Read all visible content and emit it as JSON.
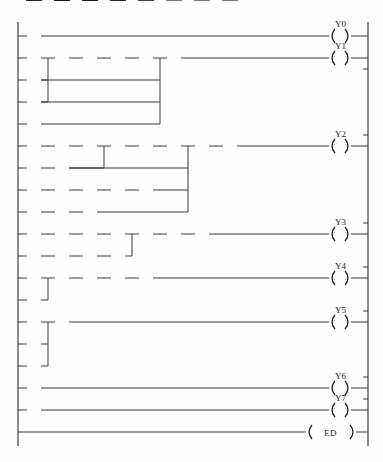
{
  "diagram": {
    "type": "ladder-logic",
    "end_instruction": "ED",
    "geometry": {
      "width": 383,
      "height": 462,
      "left_rail_x": 18,
      "right_rail_x": 368,
      "col_step": 28,
      "col0_x": 27,
      "row_step": 22,
      "row0_y": 36,
      "contact_w": 14,
      "coil_x": 340
    },
    "rungs": [
      {
        "id": "rung-1",
        "output": {
          "name": "Y0",
          "type": "coil"
        },
        "rows": [
          {
            "row": 0,
            "start_col": 0,
            "contacts": [
              {
                "name": "X0",
                "type": "NO",
                "col": 0
              }
            ]
          }
        ],
        "links": []
      },
      {
        "id": "rung-2",
        "output": {
          "name": "Y1",
          "type": "coil"
        },
        "rows": [
          {
            "row": 1,
            "start_col": 0,
            "contacts": [
              {
                "name": "X3",
                "type": "NO",
                "col": 0
              },
              {
                "name": "X1",
                "type": "NC",
                "col": 1
              },
              {
                "name": "X2",
                "type": "NC",
                "col": 2
              },
              {
                "name": "X7",
                "type": "NC",
                "col": 3
              },
              {
                "name": "XE",
                "type": "NC",
                "col": 4
              },
              {
                "name": "XD",
                "type": "NO",
                "col": 5
              }
            ]
          },
          {
            "row": 2,
            "start_col": 0,
            "contacts": [
              {
                "name": "X4",
                "type": "NO",
                "col": 0
              }
            ]
          },
          {
            "row": 3,
            "start_col": 0,
            "contacts": [
              {
                "name": "Y1",
                "type": "NO",
                "col": 0
              }
            ]
          },
          {
            "row": 4,
            "start_col": 0,
            "contacts": [
              {
                "name": "Y7",
                "type": "NO",
                "col": 0
              }
            ]
          }
        ],
        "links": [
          {
            "kind": "vertical",
            "at_col": 1,
            "from_row": 1,
            "to_row": 3
          },
          {
            "kind": "vertical",
            "at_col": 5,
            "from_row": 1,
            "to_row": 4
          }
        ]
      },
      {
        "id": "rung-3",
        "output": {
          "name": "Y2",
          "type": "coil"
        },
        "rows": [
          {
            "row": 5,
            "start_col": 0,
            "contacts": [
              {
                "name": "XB",
                "type": "NC",
                "col": 0
              },
              {
                "name": "XC",
                "type": "NC",
                "col": 1
              },
              {
                "name": "X10",
                "type": "NO",
                "col": 2
              },
              {
                "name": "X8",
                "type": "NC",
                "col": 3
              },
              {
                "name": "X9",
                "type": "NC",
                "col": 4
              },
              {
                "name": "XA",
                "type": "NC",
                "col": 5
              },
              {
                "name": "Y1",
                "type": "NO",
                "col": 6
              },
              {
                "name": "Y3",
                "type": "NC",
                "col": 7
              }
            ]
          },
          {
            "row": 6,
            "start_col": 0,
            "contacts": [
              {
                "name": "XF",
                "type": "NO",
                "col": 0
              },
              {
                "name": "XC",
                "type": "NO",
                "col": 1
              }
            ]
          },
          {
            "row": 7,
            "start_col": 0,
            "contacts": [
              {
                "name": "XA",
                "type": "NO",
                "col": 0
              },
              {
                "name": "XB",
                "type": "NC",
                "col": 1
              },
              {
                "name": "XC",
                "type": "NC",
                "col": 2
              },
              {
                "name": "XF",
                "type": "NO",
                "col": 3
              },
              {
                "name": "X11",
                "type": "NO",
                "col": 4
              }
            ]
          },
          {
            "row": 8,
            "start_col": 0,
            "contacts": [
              {
                "name": "X8",
                "type": "NO",
                "col": 0
              },
              {
                "name": "XF",
                "type": "NO",
                "col": 1
              },
              {
                "name": "X11",
                "type": "NO",
                "col": 2
              }
            ]
          }
        ],
        "links": [
          {
            "kind": "vertical",
            "at_col": 3,
            "from_row": 5,
            "to_row": 6
          },
          {
            "kind": "vertical",
            "at_col": 6,
            "from_row": 5,
            "to_row": 8
          }
        ]
      },
      {
        "id": "rung-4",
        "output": {
          "name": "Y3",
          "type": "coil"
        },
        "rows": [
          {
            "row": 9,
            "start_col": 0,
            "contacts": [
              {
                "name": "X8",
                "type": "NC",
                "col": 0
              },
              {
                "name": "X9",
                "type": "NC",
                "col": 1
              },
              {
                "name": "XA",
                "type": "NC",
                "col": 2
              },
              {
                "name": "XB",
                "type": "NO",
                "col": 3
              },
              {
                "name": "XF",
                "type": "NO",
                "col": 4
              },
              {
                "name": "Y1",
                "type": "NO",
                "col": 5
              },
              {
                "name": "Y2",
                "type": "NC",
                "col": 6
              }
            ]
          },
          {
            "row": 10,
            "start_col": 0,
            "contacts": [
              {
                "name": "X9",
                "type": "NO",
                "col": 0
              },
              {
                "name": "XB",
                "type": "NC",
                "col": 1
              },
              {
                "name": "XC",
                "type": "NC",
                "col": 2
              },
              {
                "name": "X11",
                "type": "NO",
                "col": 3
              }
            ]
          }
        ],
        "links": [
          {
            "kind": "vertical",
            "at_col": 4,
            "from_row": 9,
            "to_row": 10
          }
        ]
      },
      {
        "id": "rung-5",
        "output": {
          "name": "Y4",
          "type": "coil"
        },
        "rows": [
          {
            "row": 11,
            "start_col": 0,
            "contacts": [
              {
                "name": "X5",
                "type": "NO",
                "col": 0
              },
              {
                "name": "X1",
                "type": "NC",
                "col": 1
              },
              {
                "name": "X2",
                "type": "NC",
                "col": 2
              },
              {
                "name": "X7",
                "type": "NC",
                "col": 3
              },
              {
                "name": "XD",
                "type": "NO",
                "col": 4
              }
            ]
          },
          {
            "row": 12,
            "start_col": 0,
            "contacts": [
              {
                "name": "X6",
                "type": "NO",
                "col": 0
              }
            ]
          }
        ],
        "links": [
          {
            "kind": "vertical",
            "at_col": 1,
            "from_row": 11,
            "to_row": 12
          }
        ]
      },
      {
        "id": "rung-6",
        "output": {
          "name": "Y5",
          "type": "coil"
        },
        "rows": [
          {
            "row": 13,
            "start_col": 0,
            "contacts": [
              {
                "name": "X1",
                "type": "NO",
                "col": 0
              },
              {
                "name": "Y1",
                "type": "NC",
                "col": 1
              }
            ]
          },
          {
            "row": 14,
            "start_col": 0,
            "contacts": [
              {
                "name": "X2",
                "type": "NO",
                "col": 0
              }
            ]
          },
          {
            "row": 15,
            "start_col": 0,
            "contacts": [
              {
                "name": "XE",
                "type": "NO",
                "col": 0
              }
            ]
          }
        ],
        "links": [
          {
            "kind": "vertical",
            "at_col": 1,
            "from_row": 13,
            "to_row": 15
          }
        ]
      },
      {
        "id": "rung-7",
        "output": {
          "name": "Y6",
          "type": "coil"
        },
        "rows": [
          {
            "row": 16,
            "start_col": 0,
            "contacts": [
              {
                "name": "Y4",
                "type": "NO",
                "col": 0
              }
            ]
          }
        ],
        "links": []
      },
      {
        "id": "rung-8",
        "output": {
          "name": "Y7",
          "type": "coil"
        },
        "rows": [
          {
            "row": 17,
            "start_col": 0,
            "contacts": [
              {
                "name": "Y4",
                "type": "NC",
                "col": 0
              }
            ]
          }
        ],
        "links": []
      },
      {
        "id": "rung-9",
        "output": {
          "name": "ED",
          "type": "end"
        },
        "rows": [
          {
            "row": 18,
            "start_col": 0,
            "contacts": []
          }
        ],
        "links": []
      }
    ]
  }
}
